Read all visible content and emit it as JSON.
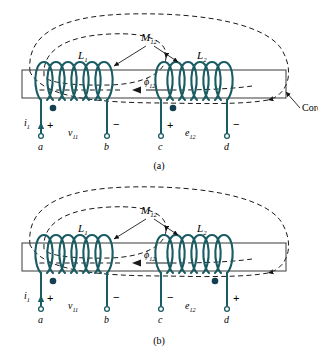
{
  "figure": {
    "type": "mutual-inductance-coupled-coils-diagram",
    "colors": {
      "coil": "#1a5c63",
      "lead": "#1a5c63",
      "dot": "#143f52",
      "core_outline": "#3a3a3a",
      "flux_dashed": "#1a1a1a",
      "text": "#000000",
      "background": "#ffffff"
    },
    "panels": [
      {
        "id": "a",
        "caption": "(a)",
        "labels": {
          "coil_left": "L",
          "coil_left_sub": "1",
          "coil_right": "L",
          "coil_right_sub": "2",
          "mutual": "M",
          "mutual_sub": "12",
          "flux": "ϕ",
          "flux_sub": "12",
          "current": "i",
          "current_sub": "1",
          "voltage_primary": "v",
          "voltage_primary_sub": "11",
          "voltage_secondary": "e",
          "voltage_secondary_sub": "12",
          "core": "Core"
        },
        "terminals": [
          {
            "name": "a",
            "polarity": "+",
            "dot": true,
            "side": "left",
            "coil": "L1"
          },
          {
            "name": "b",
            "polarity": "−",
            "dot": false,
            "side": "right",
            "coil": "L1"
          },
          {
            "name": "c",
            "polarity": "+",
            "dot": true,
            "side": "left",
            "coil": "L2"
          },
          {
            "name": "d",
            "polarity": "−",
            "dot": false,
            "side": "right",
            "coil": "L2"
          }
        ],
        "flux_direction": "leftward",
        "winding_right_coil": "same-handed-as-left",
        "core_callout": true
      },
      {
        "id": "b",
        "caption": "(b)",
        "labels": {
          "coil_left": "L",
          "coil_left_sub": "1",
          "coil_right": "L",
          "coil_right_sub": "2",
          "mutual": "M",
          "mutual_sub": "12",
          "flux": "ϕ",
          "flux_sub": "12",
          "current": "i",
          "current_sub": "1",
          "voltage_primary": "v",
          "voltage_primary_sub": "11",
          "voltage_secondary": "e",
          "voltage_secondary_sub": "12",
          "core": ""
        },
        "terminals": [
          {
            "name": "a",
            "polarity": "+",
            "dot": true,
            "side": "left",
            "coil": "L1"
          },
          {
            "name": "b",
            "polarity": "−",
            "dot": false,
            "side": "right",
            "coil": "L1"
          },
          {
            "name": "c",
            "polarity": "−",
            "dot": false,
            "side": "left",
            "coil": "L2"
          },
          {
            "name": "d",
            "polarity": "+",
            "dot": true,
            "side": "right",
            "coil": "L2"
          }
        ],
        "flux_direction": "leftward",
        "winding_right_coil": "reversed-from-left",
        "core_callout": false
      }
    ]
  }
}
